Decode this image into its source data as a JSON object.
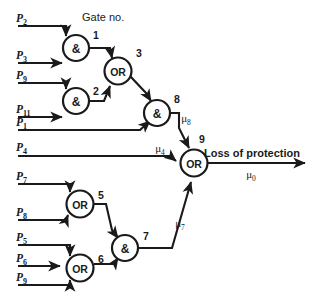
{
  "diagram": {
    "kind": "fault-tree",
    "caption": "Gate no.",
    "top_output_label": "Loss of protection",
    "top_output_rate": "μ",
    "top_output_rate_sub": "0"
  },
  "gates": [
    {
      "id": "g1",
      "number": "1",
      "type": "&",
      "cx": 76,
      "cy": 48,
      "r": 13,
      "num_x": 96,
      "num_y": 39
    },
    {
      "id": "g2",
      "number": "2",
      "type": "&",
      "cx": 76,
      "cy": 101,
      "r": 13,
      "num_x": 96,
      "num_y": 95
    },
    {
      "id": "g3",
      "number": "3",
      "type": "OR",
      "cx": 118,
      "cy": 71,
      "r": 13.5,
      "num_x": 139,
      "num_y": 57
    },
    {
      "id": "g8",
      "number": "8",
      "type": "&",
      "cx": 157,
      "cy": 113,
      "r": 13,
      "num_x": 177,
      "num_y": 103
    },
    {
      "id": "g9",
      "number": "9",
      "type": "OR",
      "cx": 194,
      "cy": 163,
      "r": 13.5,
      "num_x": 202,
      "num_y": 143
    },
    {
      "id": "g5",
      "number": "5",
      "type": "OR",
      "cx": 80,
      "cy": 204,
      "r": 13.5,
      "num_x": 101,
      "num_y": 199
    },
    {
      "id": "g6",
      "number": "6",
      "type": "OR",
      "cx": 80,
      "cy": 268,
      "r": 13.5,
      "num_x": 101,
      "num_y": 263
    },
    {
      "id": "g7",
      "number": "7",
      "type": "&",
      "cx": 125,
      "cy": 248,
      "r": 13,
      "num_x": 146,
      "num_y": 240
    }
  ],
  "inputs": [
    {
      "id": "p2",
      "base": "P",
      "sub": "2",
      "lx": 16,
      "ly": 22,
      "line_y": 26,
      "x1": 18,
      "x2": 66
    },
    {
      "id": "p3",
      "base": "P",
      "sub": "3",
      "lx": 16,
      "ly": 59,
      "line_y": 63,
      "x1": 18,
      "x2": 66
    },
    {
      "id": "p9a",
      "base": "P",
      "sub": "9",
      "lx": 16,
      "ly": 79,
      "line_y": 83,
      "x1": 18,
      "x2": 66
    },
    {
      "id": "p11",
      "base": "P",
      "sub": "11",
      "lx": 16,
      "ly": 113,
      "line_y": 117,
      "x1": 18,
      "x2": 66
    },
    {
      "id": "p1",
      "base": "P",
      "sub": "1",
      "lx": 16,
      "ly": 126,
      "line_y": 130,
      "x1": 18,
      "x2": 145
    },
    {
      "id": "p4",
      "base": "P",
      "sub": "4",
      "lx": 16,
      "ly": 151,
      "line_y": 156,
      "x1": 18,
      "x2": 180
    },
    {
      "id": "p7",
      "base": "P",
      "sub": "7",
      "lx": 16,
      "ly": 180,
      "line_y": 184,
      "x1": 18,
      "x2": 70
    },
    {
      "id": "p8",
      "base": "P",
      "sub": "8",
      "lx": 16,
      "ly": 216,
      "line_y": 220,
      "x1": 18,
      "x2": 70
    },
    {
      "id": "p5",
      "base": "P",
      "sub": "5",
      "lx": 16,
      "ly": 241,
      "line_y": 245,
      "x1": 18,
      "x2": 70
    },
    {
      "id": "p6",
      "base": "P",
      "sub": "6",
      "lx": 16,
      "ly": 262,
      "line_y": 266,
      "x1": 18,
      "x2": 66
    },
    {
      "id": "p9b",
      "base": "P",
      "sub": "9",
      "lx": 16,
      "ly": 281,
      "line_y": 285,
      "x1": 18,
      "x2": 70
    }
  ],
  "rate_labels": [
    {
      "id": "mu8",
      "base": "μ",
      "sub": "8",
      "x": 186,
      "y": 122
    },
    {
      "id": "mu4",
      "base": "μ",
      "sub": "4",
      "x": 160,
      "y": 152
    },
    {
      "id": "mu7",
      "base": "μ",
      "sub": "7",
      "x": 180,
      "y": 227
    },
    {
      "id": "mu0",
      "base": "μ",
      "sub": "0",
      "x": 251,
      "y": 178
    }
  ],
  "caption_pos": {
    "x": 82,
    "y": 21
  },
  "output_text_pos": {
    "x": 252,
    "y": 157
  },
  "colors": {
    "ink": "#1a1a1a",
    "paper": "#ffffff"
  }
}
